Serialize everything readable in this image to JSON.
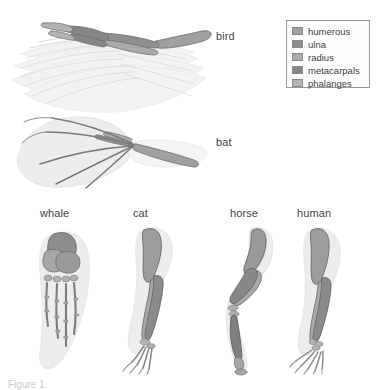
{
  "figure": {
    "background_color": "#ffffff"
  },
  "legend": {
    "name": "bone-color-legend",
    "border_color": "#9a9a9a",
    "items": [
      {
        "label": "humerous",
        "color": "#a0a0a0"
      },
      {
        "label": "ulna",
        "color": "#8f8f8f"
      },
      {
        "label": "radius",
        "color": "#aaaaaa"
      },
      {
        "label": "metacarpals",
        "color": "#868686"
      },
      {
        "label": "phalanges",
        "color": "#b4b4b4"
      }
    ]
  },
  "specimens": {
    "top_row": [
      {
        "key": "bird",
        "label": "bird",
        "label_x": 216,
        "label_y": 30
      },
      {
        "key": "bat",
        "label": "bat",
        "label_x": 216,
        "label_y": 136
      }
    ],
    "bottom_row": [
      {
        "key": "whale",
        "label": "whale",
        "label_x": 40,
        "label_y": 207
      },
      {
        "key": "cat",
        "label": "cat",
        "label_x": 133,
        "label_y": 207
      },
      {
        "key": "horse",
        "label": "horse",
        "label_x": 230,
        "label_y": 207
      },
      {
        "key": "human",
        "label": "human",
        "label_x": 297,
        "label_y": 207
      }
    ]
  },
  "caption": {
    "text": "Figure 1."
  },
  "colors": {
    "bone_humerus": "#a0a0a0",
    "bone_ulna": "#8f8f8f",
    "bone_radius": "#aaaaaa",
    "bone_metacarpals": "#868686",
    "bone_phalanges": "#b4b4b4",
    "bone_outline": "#6e6e6e",
    "soft_tissue": "#ededed",
    "text": "#444444"
  }
}
